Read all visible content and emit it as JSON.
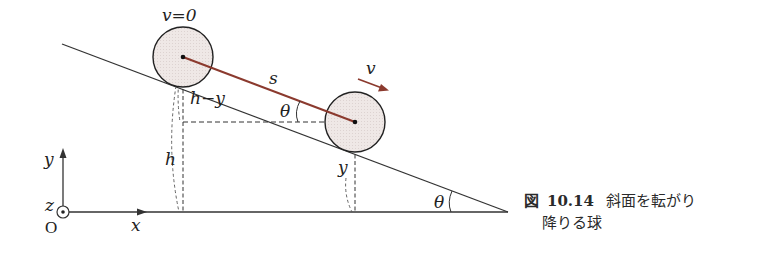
{
  "diagram": {
    "labels": {
      "v_zero": "v=0",
      "s": "s",
      "v": "v",
      "h_minus_y": "h−y",
      "theta_upper": "θ",
      "h": "h",
      "y_height": "y",
      "theta_lower": "θ",
      "y_axis": "y",
      "x_axis": "x",
      "z_axis": "z",
      "origin": "O"
    },
    "colors": {
      "line": "#333333",
      "displacement": "#8b3a2e",
      "ball_fill": "#ece5e3",
      "ball_stroke": "#222222"
    }
  },
  "caption": {
    "figure_label": "図",
    "figure_number": "10.14",
    "text_line1": "斜面を転がり",
    "text_line2": "降りる球"
  }
}
